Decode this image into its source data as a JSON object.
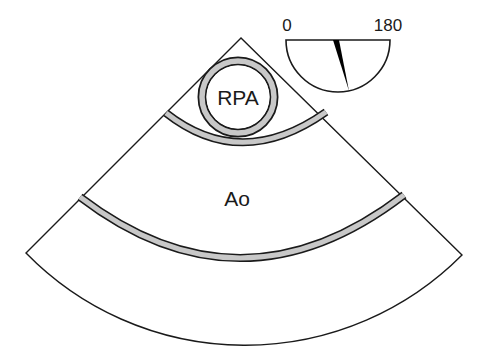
{
  "diagram": {
    "labels": {
      "rpa": "RPA",
      "ao": "Ao"
    },
    "angle_indicator": {
      "min_label": "0",
      "max_label": "180",
      "needle_angle_deg": 75
    },
    "colors": {
      "line": "#1a1a1a",
      "wall_fill": "#c8c8c8",
      "background": "#ffffff",
      "needle": "#000000"
    }
  }
}
